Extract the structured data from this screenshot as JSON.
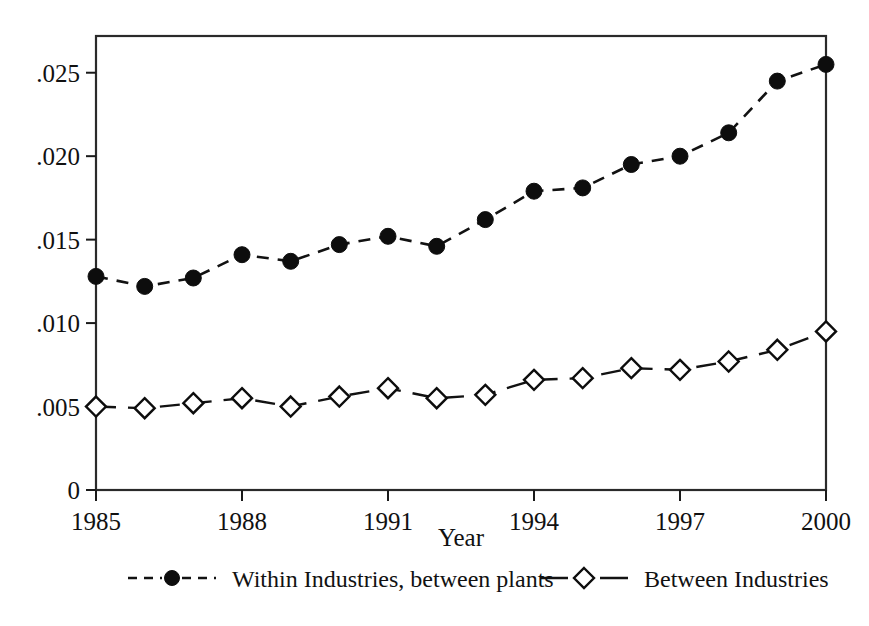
{
  "chart_data": {
    "type": "line",
    "title": "",
    "subtitle": "",
    "xlabel": "Year",
    "ylabel": "",
    "x": [
      1985,
      1986,
      1987,
      1988,
      1989,
      1990,
      1991,
      1992,
      1993,
      1994,
      1995,
      1996,
      1997,
      1998,
      1999,
      2000
    ],
    "categories": [
      "1985",
      "1986",
      "1987",
      "1988",
      "1989",
      "1990",
      "1991",
      "1992",
      "1993",
      "1994",
      "1995",
      "1996",
      "1997",
      "1998",
      "1999",
      "2000"
    ],
    "series": [
      {
        "name": "Within Industries, between plants",
        "marker": "filled-circle",
        "linestyle": "dashed",
        "color": "#0d0d0d",
        "values": [
          0.0128,
          0.0122,
          0.0127,
          0.0141,
          0.0137,
          0.0147,
          0.0152,
          0.0146,
          0.0162,
          0.0179,
          0.0181,
          0.0195,
          0.02,
          0.0214,
          0.0245,
          0.0255
        ]
      },
      {
        "name": "Between Industries",
        "marker": "open-diamond",
        "linestyle": "dashed",
        "color": "#0d0d0d",
        "values": [
          0.005,
          0.0049,
          0.0052,
          0.0055,
          0.005,
          0.0056,
          0.0061,
          0.0055,
          0.0057,
          0.0066,
          0.0067,
          0.0073,
          0.0072,
          0.0077,
          0.0084,
          0.0095
        ]
      }
    ],
    "xlim": [
      1985,
      2000
    ],
    "ylim": [
      0,
      0.0272
    ],
    "xticks": [
      1985,
      1988,
      1991,
      1994,
      1997,
      2000
    ],
    "xtick_labels": [
      "1985",
      "1988",
      "1991",
      "1994",
      "1997",
      "2000"
    ],
    "yticks": [
      0,
      0.005,
      0.01,
      0.015,
      0.02,
      0.025
    ],
    "ytick_labels": [
      "0",
      ".005",
      ".010",
      ".015",
      ".020",
      ".025"
    ],
    "grid": false,
    "legend_position": "bottom-outside",
    "frame": "box"
  },
  "axes": {
    "x_title": "Year",
    "y_title": "",
    "y_tick_labels": [
      "0",
      ".005",
      ".010",
      ".015",
      ".020",
      ".025"
    ],
    "x_tick_labels": [
      "1985",
      "1988",
      "1991",
      "1994",
      "1997",
      "2000"
    ]
  },
  "legend": {
    "entries": [
      {
        "label": "Within Industries, between plants",
        "marker": "filled-circle"
      },
      {
        "label": "Between Industries",
        "marker": "open-diamond"
      }
    ]
  },
  "colors": {
    "ink": "#111111",
    "marker_fill": "#0d0d0d",
    "marker_open_fill": "#ffffff",
    "background": "#ffffff"
  }
}
